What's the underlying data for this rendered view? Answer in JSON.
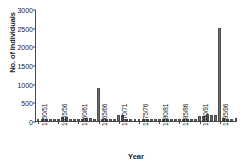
{
  "chart_data": {
    "type": "bar",
    "title": "",
    "xlabel": "Year",
    "ylabel": "No. of Individuals",
    "ylim": [
      0,
      3000
    ],
    "yticks": [
      0,
      500,
      1000,
      1500,
      2000,
      2500,
      3000
    ],
    "grid": false,
    "legend": null,
    "bar_color": "#6e6e6e",
    "axis_color": "#4a4a4a",
    "tick_labels": [
      "1950/51",
      "1955/56",
      "1960/61",
      "1965/66",
      "1970/71",
      "1975/76",
      "1980/81",
      "1985/86",
      "1990/91",
      "1995/96"
    ],
    "tick_label_indices": [
      0,
      5,
      10,
      15,
      20,
      25,
      30,
      35,
      40,
      45
    ],
    "categories": [
      "1950/51",
      "1951/52",
      "1952/53",
      "1953/54",
      "1954/55",
      "1955/56",
      "1956/57",
      "1957/58",
      "1958/59",
      "1959/60",
      "1960/61",
      "1961/62",
      "1962/63",
      "1963/64",
      "1964/65",
      "1965/66",
      "1966/67",
      "1967/68",
      "1968/69",
      "1969/70",
      "1970/71",
      "1971/72",
      "1972/73",
      "1973/74",
      "1974/75",
      "1975/76",
      "1976/77",
      "1977/78",
      "1978/79",
      "1979/80",
      "1980/81",
      "1981/82",
      "1982/83",
      "1983/84",
      "1984/85",
      "1985/86",
      "1986/87",
      "1987/88",
      "1988/89",
      "1989/90",
      "1990/91",
      "1991/92",
      "1992/93",
      "1993/94",
      "1994/95",
      "1995/96",
      "1996/97",
      "1997/98",
      "1998/99",
      "1999/00"
    ],
    "values": [
      10,
      5,
      8,
      20,
      15,
      40,
      110,
      95,
      55,
      50,
      45,
      60,
      70,
      70,
      35,
      880,
      30,
      25,
      20,
      20,
      155,
      165,
      30,
      20,
      15,
      50,
      50,
      40,
      15,
      10,
      5,
      10,
      5,
      5,
      10,
      35,
      35,
      20,
      15,
      15,
      130,
      135,
      195,
      170,
      160,
      2500,
      85,
      25,
      20,
      70
    ]
  }
}
